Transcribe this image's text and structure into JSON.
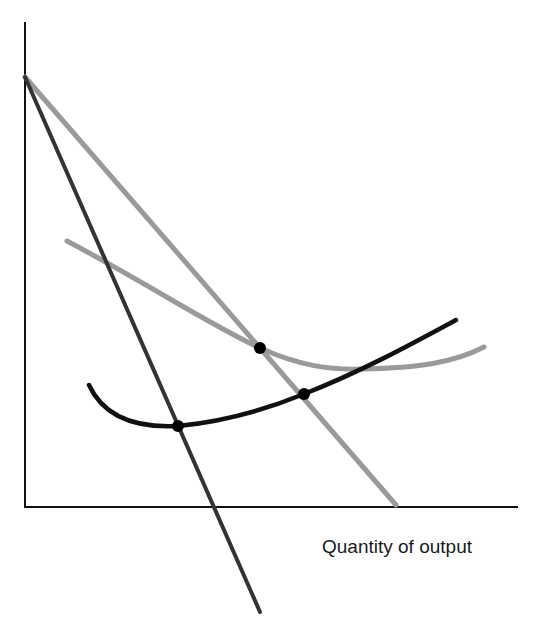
{
  "diagram": {
    "x_axis_label": "Quantity of output",
    "y_axis_label": "",
    "colors": {
      "axis": "#111111",
      "dark_line": "#333333",
      "gray": "#999999",
      "black_curve": "#111111",
      "dot": "#000000"
    },
    "elements": [
      {
        "name": "steep-dark-line",
        "desc": "straight dark line from top of vertical axis falling steeply below horizontal axis"
      },
      {
        "name": "gray-straight-line",
        "desc": "straight gray line from top of vertical axis to horizontal axis"
      },
      {
        "name": "gray-u-curve",
        "desc": "gray U-shaped curve"
      },
      {
        "name": "black-curve",
        "desc": "black upward-sloping curve with minimum near left"
      }
    ],
    "points": [
      {
        "name": "gray-line-meets-gray-curve",
        "x": 260,
        "y": 348
      },
      {
        "name": "gray-line-meets-black-curve",
        "x": 304,
        "y": 394
      },
      {
        "name": "dark-line-meets-black-curve",
        "x": 178,
        "y": 426
      }
    ]
  }
}
